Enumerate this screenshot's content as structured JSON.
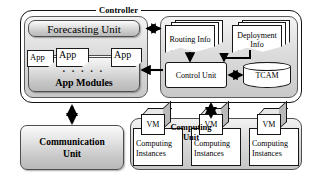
{
  "diagram": {
    "controller": {
      "label": "Controller",
      "left_panel": {
        "forecasting_unit": "Forecasting Unit",
        "app_modules": "App Modules",
        "apps": [
          {
            "label": "App"
          },
          {
            "label": "App"
          },
          {
            "label": "App"
          }
        ],
        "ellipsis": "· · · · ·"
      },
      "right_panel": {
        "routing_info": "Routing Info",
        "deployment_info": "Deployment Info",
        "control_unit": "Control Unit",
        "tcam": "TCAM"
      }
    },
    "communication_unit": "Communication Unit",
    "communication_unit_line1": "Communication",
    "communication_unit_line2": "Unit",
    "computing_unit": {
      "label_line1": "Computing",
      "label_line2": "Unit",
      "instances": [
        {
          "vm": "VM",
          "line1": "Computing",
          "line2": "Instances"
        },
        {
          "vm": "VM",
          "line1": "Computing",
          "line2": "Instances"
        },
        {
          "vm": "VM",
          "line1": "Computing",
          "line2": "Instances"
        }
      ]
    },
    "colors": {
      "outline": "#111111",
      "panel_fill_light": "#f4f4f4",
      "panel_fill_dark": "#c9c9c9",
      "unit_fill": "#d8d8d8",
      "doc_fill": "#ffffff",
      "background": "#ffffff"
    }
  }
}
